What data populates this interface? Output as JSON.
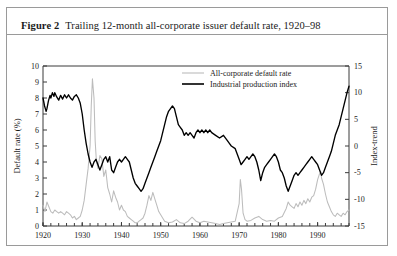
{
  "figure": {
    "number_label": "Figure 2",
    "caption": "Trailing 12-month all-corporate issuer default rate, 1920–98"
  },
  "legend": {
    "position": "top-center-right",
    "entries": [
      {
        "label": "All-corporate default rate",
        "color": "#bcbcbc",
        "key": "default_rate"
      },
      {
        "label": "Industrial production index",
        "color": "#000000",
        "key": "industrial_production"
      }
    ]
  },
  "axes": {
    "left": {
      "title": "Default rate (%)",
      "ticks": [
        "0",
        "1",
        "2",
        "3",
        "4",
        "5",
        "6",
        "7",
        "8",
        "9",
        "10"
      ],
      "min": 0,
      "max": 10
    },
    "right": {
      "title": "Index-trend",
      "ticks": [
        "-15",
        "-10",
        "-5",
        "0",
        "5",
        "10",
        "15"
      ],
      "min": -15,
      "max": 15
    },
    "bottom": {
      "title": "",
      "ticks": [
        "1920",
        "1930",
        "1940",
        "1950",
        "1960",
        "1970",
        "1980",
        "1990"
      ],
      "min": 1920,
      "max": 1998
    }
  },
  "chart_data": {
    "type": "line",
    "title": "Trailing 12-month all-corporate issuer default rate, 1920–98",
    "xlabel": "",
    "ylabel": "Default rate (%)",
    "y2label": "Index-trend",
    "xlim": [
      1920,
      1998
    ],
    "ylim": [
      0,
      10
    ],
    "y2lim": [
      -15,
      15
    ],
    "grid": false,
    "legend_position": "top-center",
    "xticks": [
      1920,
      1930,
      1940,
      1950,
      1960,
      1970,
      1980,
      1990
    ],
    "yticks": [
      0,
      1,
      2,
      3,
      4,
      5,
      6,
      7,
      8,
      9,
      10
    ],
    "y2ticks": [
      -15,
      -10,
      -5,
      0,
      5,
      10,
      15
    ],
    "series": [
      {
        "name": "All-corporate default rate",
        "axis": "left",
        "units": "percent",
        "color": "#bcbcbc",
        "x": [
          1920,
          1920.5,
          1921,
          1921.5,
          1922,
          1922.5,
          1923,
          1923.5,
          1924,
          1924.5,
          1925,
          1925.5,
          1926,
          1926.5,
          1927,
          1927.5,
          1928,
          1928.5,
          1929,
          1929.5,
          1930,
          1930.5,
          1931,
          1931.5,
          1932,
          1932.3,
          1932.6,
          1933,
          1933.3,
          1933.6,
          1934,
          1934.5,
          1935,
          1935.5,
          1936,
          1936.5,
          1937,
          1937.5,
          1938,
          1938.5,
          1939,
          1939.5,
          1940,
          1940.5,
          1941,
          1941.5,
          1942,
          1942.5,
          1943,
          1943.5,
          1944,
          1944.5,
          1945,
          1945.5,
          1946,
          1946.5,
          1947,
          1947.5,
          1948,
          1948.5,
          1949,
          1949.5,
          1950,
          1950.5,
          1951,
          1952,
          1953,
          1954,
          1955,
          1956,
          1957,
          1958,
          1959,
          1960,
          1961,
          1962,
          1963,
          1964,
          1965,
          1966,
          1967,
          1968,
          1969,
          1970,
          1970.3,
          1970.6,
          1971,
          1971.5,
          1972,
          1973,
          1974,
          1975,
          1976,
          1977,
          1978,
          1979,
          1980,
          1981,
          1982,
          1982.5,
          1983,
          1983.5,
          1984,
          1984.5,
          1985,
          1985.5,
          1986,
          1986.5,
          1987,
          1987.5,
          1988,
          1988.5,
          1989,
          1989.5,
          1990,
          1990.4,
          1990.8,
          1991,
          1991.5,
          1992,
          1992.5,
          1993,
          1993.5,
          1994,
          1994.5,
          1995,
          1995.5,
          1996,
          1996.5,
          1997,
          1997.5,
          1998
        ],
        "y": [
          1.3,
          0.9,
          1.5,
          1.2,
          0.9,
          0.8,
          1.0,
          0.9,
          0.8,
          0.9,
          0.8,
          0.7,
          0.9,
          0.8,
          0.7,
          0.5,
          0.6,
          0.4,
          0.5,
          0.6,
          1.0,
          1.6,
          2.6,
          3.6,
          5.0,
          7.5,
          9.2,
          8.0,
          5.3,
          4.1,
          3.6,
          4.4,
          4.2,
          3.1,
          3.5,
          2.4,
          2.0,
          1.5,
          2.2,
          1.8,
          1.5,
          1.0,
          1.3,
          1.0,
          0.9,
          0.6,
          0.5,
          0.4,
          0.3,
          0.2,
          0.2,
          0.3,
          0.4,
          0.5,
          0.8,
          1.3,
          1.9,
          1.6,
          2.1,
          1.7,
          1.3,
          0.9,
          0.7,
          0.5,
          0.3,
          0.2,
          0.25,
          0.4,
          0.2,
          0.15,
          0.3,
          0.55,
          0.3,
          0.2,
          0.3,
          0.25,
          0.2,
          0.15,
          0.1,
          0.15,
          0.2,
          0.25,
          0.3,
          1.4,
          2.9,
          2.3,
          0.8,
          0.4,
          0.3,
          0.35,
          0.5,
          0.6,
          0.4,
          0.3,
          0.35,
          0.3,
          0.5,
          0.6,
          1.1,
          1.5,
          1.3,
          1.2,
          1.1,
          1.4,
          1.2,
          1.5,
          1.3,
          1.6,
          1.4,
          1.7,
          1.5,
          1.8,
          1.9,
          2.3,
          2.9,
          3.2,
          3.4,
          3.0,
          2.6,
          2.0,
          1.5,
          1.2,
          0.9,
          0.7,
          0.6,
          0.8,
          0.7,
          0.6,
          0.8,
          0.7,
          0.9,
          1.0
        ]
      },
      {
        "name": "Industrial production index",
        "axis": "right",
        "units": "index-trend",
        "color": "#000000",
        "x": [
          1920,
          1920.4,
          1920.8,
          1921,
          1921.4,
          1921.8,
          1922,
          1922.4,
          1922.8,
          1923,
          1923.5,
          1924,
          1924.5,
          1925,
          1925.5,
          1926,
          1926.5,
          1927,
          1927.5,
          1928,
          1928.5,
          1929,
          1929.5,
          1930,
          1930.5,
          1931,
          1931.5,
          1932,
          1932.5,
          1933,
          1933.5,
          1934,
          1934.5,
          1935,
          1935.5,
          1936,
          1936.5,
          1937,
          1937.5,
          1938,
          1938.5,
          1939,
          1939.5,
          1940,
          1940.5,
          1941,
          1941.5,
          1942,
          1942.5,
          1943,
          1943.5,
          1944,
          1944.5,
          1945,
          1945.5,
          1946,
          1946.5,
          1947,
          1947.5,
          1948,
          1948.5,
          1949,
          1949.5,
          1950,
          1950.5,
          1951,
          1951.5,
          1952,
          1952.5,
          1953,
          1953.5,
          1954,
          1954.5,
          1955,
          1955.5,
          1956,
          1956.5,
          1957,
          1957.5,
          1958,
          1958.5,
          1959,
          1959.5,
          1960,
          1960.5,
          1961,
          1961.5,
          1962,
          1962.5,
          1963,
          1964,
          1965,
          1966,
          1967,
          1967.5,
          1968,
          1969,
          1969.5,
          1970,
          1970.5,
          1971,
          1971.5,
          1972,
          1972.5,
          1973,
          1973.5,
          1974,
          1974.5,
          1975,
          1975.5,
          1976,
          1976.5,
          1977,
          1977.5,
          1978,
          1978.5,
          1979,
          1979.5,
          1980,
          1980.5,
          1981,
          1981.5,
          1982,
          1982.5,
          1983,
          1983.5,
          1984,
          1984.5,
          1985,
          1985.5,
          1986,
          1986.5,
          1987,
          1987.5,
          1988,
          1988.5,
          1989,
          1989.5,
          1990,
          1990.5,
          1991,
          1991.5,
          1992,
          1992.5,
          1993,
          1993.5,
          1994,
          1994.5,
          1995,
          1995.5,
          1996,
          1996.5,
          1997,
          1997.5,
          1998
        ],
        "y": [
          9.0,
          7.5,
          6.5,
          7.0,
          8.5,
          9.5,
          9.0,
          10.0,
          9.3,
          10.0,
          9.2,
          8.6,
          9.5,
          8.8,
          9.6,
          9.0,
          9.6,
          9.0,
          8.6,
          9.3,
          9.6,
          9.0,
          8.0,
          6.0,
          3.0,
          0.5,
          -1.5,
          -3.0,
          -4.0,
          -3.0,
          -2.5,
          -3.5,
          -4.5,
          -3.5,
          -2.5,
          -2.0,
          -3.0,
          -2.0,
          -4.5,
          -5.0,
          -4.0,
          -3.0,
          -2.5,
          -3.0,
          -2.5,
          -2.0,
          -2.5,
          -3.0,
          -4.5,
          -6.0,
          -7.0,
          -7.5,
          -8.0,
          -8.5,
          -8.0,
          -7.0,
          -6.0,
          -5.0,
          -4.0,
          -3.0,
          -2.0,
          -1.0,
          0.0,
          1.0,
          2.5,
          4.0,
          5.5,
          6.5,
          7.0,
          7.5,
          7.0,
          5.5,
          4.0,
          3.5,
          3.0,
          2.0,
          2.5,
          2.0,
          2.5,
          2.0,
          1.5,
          2.5,
          3.0,
          2.5,
          3.0,
          2.5,
          3.0,
          2.5,
          3.0,
          2.5,
          2.0,
          1.5,
          2.0,
          1.0,
          0.5,
          0.0,
          -0.5,
          -1.5,
          -2.5,
          -3.5,
          -3.0,
          -2.5,
          -2.0,
          -2.5,
          -2.0,
          -1.5,
          -2.0,
          -3.0,
          -4.5,
          -6.5,
          -5.0,
          -4.0,
          -3.5,
          -3.0,
          -2.5,
          -2.0,
          -1.5,
          -2.0,
          -3.0,
          -4.5,
          -5.0,
          -6.0,
          -7.5,
          -8.5,
          -7.5,
          -6.5,
          -5.5,
          -5.0,
          -5.5,
          -5.0,
          -4.5,
          -4.0,
          -3.5,
          -3.0,
          -2.5,
          -2.0,
          -2.5,
          -3.0,
          -3.5,
          -4.5,
          -5.5,
          -5.0,
          -4.0,
          -3.0,
          -2.0,
          -1.0,
          0.5,
          2.0,
          3.0,
          4.0,
          5.5,
          7.0,
          8.5,
          10.0,
          11.2
        ]
      }
    ]
  }
}
